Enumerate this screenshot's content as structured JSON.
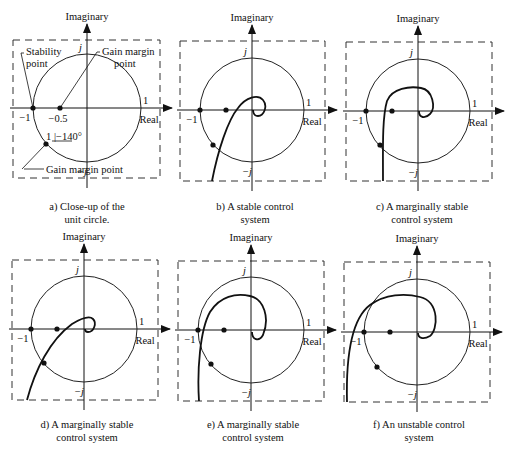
{
  "axis_labels": {
    "imag": "Imaginary",
    "real": "Real",
    "one": "1",
    "minus_one": "−1",
    "j": "j",
    "minus_j": "−j"
  },
  "panel_a_annotations": {
    "stability_point": [
      "Stability",
      "point"
    ],
    "gain_margin_point_top": [
      "Gain margin",
      "point"
    ],
    "minus_half": "−0.5",
    "angle": "1 |−140°",
    "gain_margin_point_bottom": "Gain margin point"
  },
  "panels": [
    {
      "id": "a",
      "caption": [
        "a) Close-up of the",
        "unit circle."
      ],
      "box": [
        13,
        40,
        160,
        178
      ],
      "cx": 87,
      "cy": 108,
      "r": 54,
      "curve": ""
    },
    {
      "id": "b",
      "caption": [
        "b) A stable control",
        "system"
      ],
      "box": [
        180,
        41,
        325,
        181
      ],
      "cx": 252,
      "cy": 110,
      "r": 52,
      "curve": "M212,181 C218,150 228,120 238,108 C246,97 258,94 263,100 C268,106 264,116 258,116 C254,116 253,112 253,110"
    },
    {
      "id": "c",
      "caption": [
        "c) A marginally stable",
        "control system"
      ],
      "box": [
        346,
        42,
        492,
        181
      ],
      "cx": 418,
      "cy": 111,
      "r": 52,
      "curve": "M383,181 C383,150 382,118 387,101 C392,88 410,86 421,88 C433,90 436,108 430,114 C425,119 419,118 419,111"
    },
    {
      "id": "d",
      "caption": [
        "d) A marginally stable",
        "control system"
      ],
      "box": [
        12,
        260,
        158,
        400
      ],
      "cx": 84,
      "cy": 329,
      "r": 53,
      "curve": "M27,400 C35,370 50,340 72,324 C82,318 90,316 93,319 C97,323 94,332 88,332 C85,332 85,330 85,329"
    },
    {
      "id": "e",
      "caption": [
        "e) A marginally stable",
        "control system"
      ],
      "box": [
        178,
        261,
        324,
        401
      ],
      "cx": 251,
      "cy": 330,
      "r": 53,
      "curve": "M199,401 C197,370 200,330 210,312 C220,296 236,293 250,296 C264,299 270,318 263,335 C259,342 252,340 252,332"
    },
    {
      "id": "f",
      "caption": [
        "f) An unstable control",
        "system"
      ],
      "box": [
        344,
        262,
        490,
        402
      ],
      "cx": 417,
      "cy": 332,
      "r": 53,
      "curve": "M347,402 C346,360 350,320 370,305 C385,294 405,293 420,297 C440,302 438,330 430,336 C423,340 418,338 418,333"
    }
  ],
  "markers": {
    "a": [
      [
        33,
        108
      ],
      [
        60,
        108
      ],
      [
        46,
        144
      ]
    ],
    "b": [
      [
        200,
        110
      ],
      [
        226,
        110
      ],
      [
        213,
        145
      ]
    ],
    "c": [
      [
        366,
        111
      ],
      [
        392,
        111
      ],
      [
        380,
        145
      ]
    ],
    "d": [
      [
        31,
        329
      ],
      [
        57,
        329
      ],
      [
        44,
        363
      ]
    ],
    "e": [
      [
        198,
        330
      ],
      [
        224,
        330
      ],
      [
        211,
        364
      ]
    ],
    "f": [
      [
        364,
        332
      ],
      [
        390,
        332
      ],
      [
        377,
        367
      ]
    ]
  }
}
